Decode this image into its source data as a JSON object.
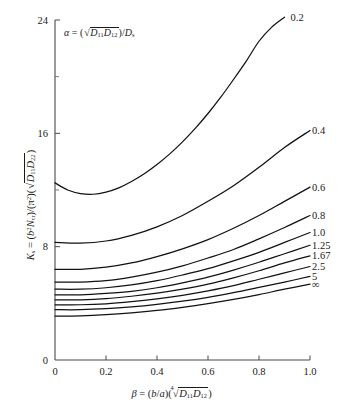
{
  "figure": {
    "background_color": "#ffffff",
    "curve_color": "#111111",
    "axis_color": "#4a4a4a",
    "annotation": {
      "alpha_symbol": "α",
      "equals": " = (",
      "sqrt_body_1": "D",
      "sqrt_sub_1": "11",
      "sqrt_body_2": "D",
      "sqrt_sub_2": "12",
      "tail_open": ")/",
      "tail_var": "D",
      "tail_sub": "s"
    },
    "ylabel": {
      "symbol": "K",
      "symbol_sub": "s",
      "equals": " = (",
      "num_var": "b",
      "num_sup": "2",
      "num_var2": "N",
      "num_sub2": "cr",
      "mid": ")/(",
      "pi": "π",
      "pi_sup": "2",
      "close": ")(",
      "sqrt_body_1": "D",
      "sqrt_sub_1": "11",
      "sqrt_body_2": "D",
      "sqrt_sub_2": "22",
      "end": ")"
    },
    "xlabel": {
      "symbol": "β",
      "equals": " = (",
      "ratio_num": "b",
      "slash": "/",
      "ratio_den": "a",
      "mid": ")(",
      "root_index": "4",
      "sqrt_body_1": "D",
      "sqrt_sub_1": "11",
      "sqrt_body_2": "D",
      "sqrt_sub_2": "12",
      "end": ")"
    }
  },
  "chart_data": {
    "type": "line",
    "title": "",
    "subtitle": "",
    "xlabel": "β = (b/a)(⁴√(D11 D12))",
    "ylabel": "Ks = (b²Ncr)/(π²)(√(D11 D22))",
    "xlim": [
      0,
      1.0
    ],
    "ylim": [
      0,
      24
    ],
    "xticks": [
      0,
      0.2,
      0.4,
      0.6,
      0.8,
      1.0
    ],
    "xtick_labels": [
      "0",
      "0.2",
      "0.4",
      "0.6",
      "0.8",
      "1.0"
    ],
    "yticks": [
      0,
      8,
      16,
      24
    ],
    "ytick_labels": [
      "0",
      "8",
      "16",
      "24"
    ],
    "yticks_minor": [
      12,
      20
    ],
    "grid": false,
    "legend_position": "right-of-curve-ends",
    "legend_title": "α",
    "series": [
      {
        "name": "0.2",
        "label": "0.2",
        "x": [
          0.0,
          0.05,
          0.1,
          0.15,
          0.2,
          0.25,
          0.3,
          0.35,
          0.4,
          0.45,
          0.5,
          0.55,
          0.6,
          0.65,
          0.7,
          0.75,
          0.8,
          0.85,
          0.9
        ],
        "values": [
          12.5,
          12.0,
          11.75,
          11.7,
          11.85,
          12.15,
          12.6,
          13.15,
          13.8,
          14.55,
          15.4,
          16.35,
          17.4,
          18.55,
          19.8,
          21.1,
          22.5,
          23.5,
          24.2
        ]
      },
      {
        "name": "0.4",
        "label": "0.4",
        "x": [
          0.0,
          0.1,
          0.2,
          0.3,
          0.4,
          0.5,
          0.6,
          0.7,
          0.8,
          0.9,
          1.0
        ],
        "values": [
          8.3,
          8.25,
          8.4,
          8.8,
          9.4,
          10.2,
          11.2,
          12.3,
          13.6,
          15.0,
          16.2
        ]
      },
      {
        "name": "0.6",
        "label": "0.6",
        "x": [
          0.0,
          0.1,
          0.2,
          0.3,
          0.4,
          0.5,
          0.6,
          0.7,
          0.8,
          0.9,
          1.0
        ],
        "values": [
          6.4,
          6.4,
          6.55,
          6.85,
          7.3,
          7.85,
          8.5,
          9.3,
          10.2,
          11.2,
          12.2
        ]
      },
      {
        "name": "0.8",
        "label": "0.8",
        "x": [
          0.0,
          0.1,
          0.2,
          0.3,
          0.4,
          0.5,
          0.6,
          0.7,
          0.8,
          0.9,
          1.0
        ],
        "values": [
          5.5,
          5.5,
          5.6,
          5.85,
          6.2,
          6.65,
          7.2,
          7.8,
          8.55,
          9.35,
          10.2
        ]
      },
      {
        "name": "1.0",
        "label": "1.0",
        "x": [
          0.0,
          0.1,
          0.2,
          0.3,
          0.4,
          0.5,
          0.6,
          0.7,
          0.8,
          0.9,
          1.0
        ],
        "values": [
          5.0,
          5.0,
          5.1,
          5.3,
          5.6,
          6.0,
          6.45,
          7.0,
          7.6,
          8.3,
          9.0
        ]
      },
      {
        "name": "1.25",
        "label": "1.25",
        "x": [
          0.0,
          0.1,
          0.2,
          0.3,
          0.4,
          0.5,
          0.6,
          0.7,
          0.8,
          0.9,
          1.0
        ],
        "values": [
          4.6,
          4.6,
          4.7,
          4.85,
          5.1,
          5.45,
          5.85,
          6.35,
          6.9,
          7.5,
          8.1
        ]
      },
      {
        "name": "1.67",
        "label": "1.67",
        "x": [
          0.0,
          0.1,
          0.2,
          0.3,
          0.4,
          0.5,
          0.6,
          0.7,
          0.8,
          0.9,
          1.0
        ],
        "values": [
          4.25,
          4.25,
          4.33,
          4.5,
          4.72,
          5.0,
          5.35,
          5.8,
          6.3,
          6.85,
          7.35
        ]
      },
      {
        "name": "2.5",
        "label": "2.5",
        "x": [
          0.0,
          0.1,
          0.2,
          0.3,
          0.4,
          0.5,
          0.6,
          0.7,
          0.8,
          0.9,
          1.0
        ],
        "values": [
          3.9,
          3.9,
          3.97,
          4.12,
          4.32,
          4.57,
          4.88,
          5.25,
          5.7,
          6.15,
          6.6
        ]
      },
      {
        "name": "5",
        "label": "5",
        "x": [
          0.0,
          0.1,
          0.2,
          0.3,
          0.4,
          0.5,
          0.6,
          0.7,
          0.8,
          0.9,
          1.0
        ],
        "values": [
          3.55,
          3.55,
          3.62,
          3.75,
          3.93,
          4.15,
          4.42,
          4.75,
          5.12,
          5.5,
          5.9
        ]
      },
      {
        "name": "inf",
        "label": "∞",
        "x": [
          0.0,
          0.1,
          0.2,
          0.3,
          0.4,
          0.5,
          0.6,
          0.7,
          0.8,
          0.9,
          1.0
        ],
        "values": [
          3.1,
          3.12,
          3.2,
          3.33,
          3.5,
          3.72,
          3.98,
          4.28,
          4.62,
          5.0,
          5.35
        ]
      }
    ]
  }
}
